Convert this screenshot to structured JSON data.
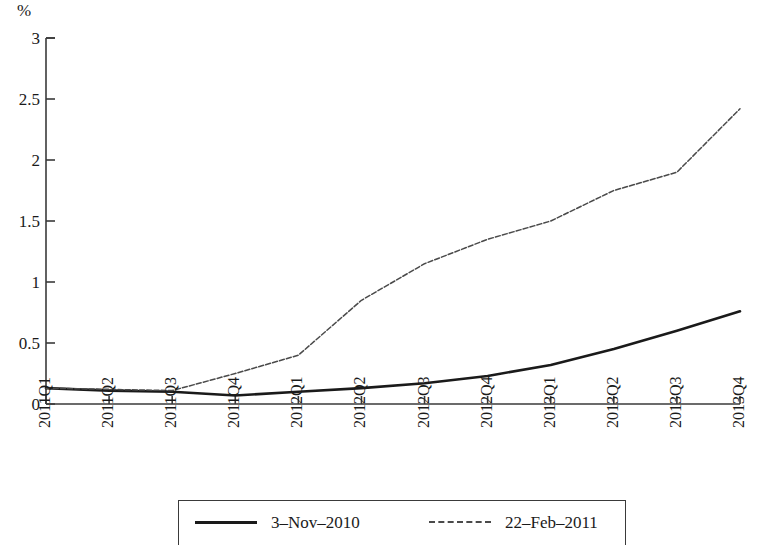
{
  "chart_data": {
    "type": "line",
    "title": "",
    "subtitle": "",
    "xlabel": "",
    "ylabel": "",
    "unit_label": "%",
    "categories": [
      "2011Q1",
      "2011Q2",
      "2011Q3",
      "2011Q4",
      "2012Q1",
      "2012Q2",
      "2012Q3",
      "2012Q4",
      "2013Q1",
      "2013Q2",
      "2013Q3",
      "2013Q4"
    ],
    "yticks": [
      "0",
      "0.5",
      "1",
      "1.5",
      "2",
      "2.5",
      "3"
    ],
    "ytick_values": [
      0,
      0.5,
      1,
      1.5,
      2,
      2.5,
      3
    ],
    "ylim": [
      0,
      3
    ],
    "grid": false,
    "legend_position": "bottom",
    "series": [
      {
        "name": "3-Nov-2010",
        "style": "solid",
        "color": "#1a1a1a",
        "values": [
          0.13,
          0.11,
          0.1,
          0.07,
          0.1,
          0.13,
          0.17,
          0.23,
          0.32,
          0.45,
          0.6,
          0.76
        ]
      },
      {
        "name": "22-Feb-2011",
        "style": "dashed",
        "color": "#4a4a4a",
        "values": [
          0.13,
          0.12,
          0.11,
          0.25,
          0.4,
          0.85,
          1.15,
          1.35,
          1.5,
          1.75,
          1.9,
          2.42
        ]
      }
    ]
  },
  "legend": {
    "entries": [
      {
        "label": "3–Nov–2010"
      },
      {
        "label": "22–Feb–2011"
      }
    ]
  }
}
